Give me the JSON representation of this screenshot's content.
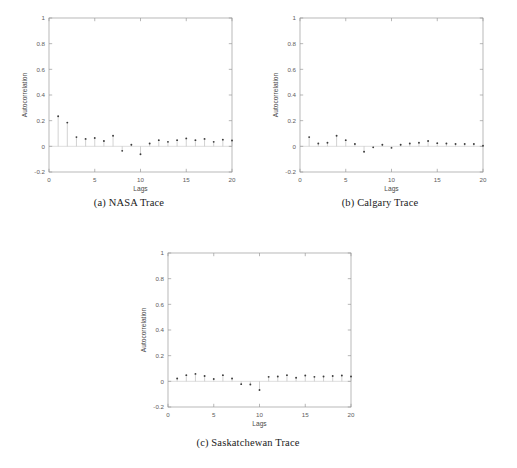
{
  "figure": {
    "background_color": "#ffffff",
    "axis_color": "#9a9a9a",
    "stem_color": "#b9b9b9",
    "marker_color": "#3c3c3c",
    "panels": [
      {
        "id": "nasa",
        "caption": "(a) NASA Trace",
        "caption_label": "(a)",
        "caption_title": "NASA Trace"
      },
      {
        "id": "calgary",
        "caption": "(b) Calgary Trace",
        "caption_label": "(b)",
        "caption_title": "Calgary Trace"
      },
      {
        "id": "saskatchewan",
        "caption": "(c) Saskatchewan Trace",
        "caption_label": "(c)",
        "caption_title": "Saskatchewan Trace"
      }
    ]
  },
  "chart_data": [
    {
      "type": "scatter",
      "id": "nasa",
      "title": "(a) NASA Trace",
      "xlabel": "Lags",
      "ylabel": "Autocorrelation",
      "xlim": [
        0,
        20
      ],
      "ylim": [
        -0.2,
        1
      ],
      "xticks": [
        0,
        5,
        10,
        15,
        20
      ],
      "yticks": [
        -0.2,
        0,
        0.2,
        0.4,
        0.6,
        0.8,
        1
      ],
      "xticklabels": [
        "0",
        "5",
        "10",
        "15",
        "20"
      ],
      "yticklabels": [
        "-0.2",
        "0",
        "0.2",
        "0.4",
        "0.6",
        "0.8",
        "1"
      ],
      "grid": false,
      "legend": "none",
      "x": [
        1,
        2,
        3,
        4,
        5,
        6,
        7,
        8,
        9,
        10,
        11,
        12,
        13,
        14,
        15,
        16,
        17,
        18,
        19,
        20
      ],
      "values": [
        0.235,
        0.185,
        0.072,
        0.058,
        0.065,
        0.042,
        0.082,
        -0.035,
        0.012,
        -0.062,
        0.022,
        0.048,
        0.035,
        0.048,
        0.062,
        0.048,
        0.058,
        0.035,
        0.052,
        0.045
      ]
    },
    {
      "type": "scatter",
      "id": "calgary",
      "title": "(b) Calgary Trace",
      "xlabel": "Lags",
      "ylabel": "Autocorrelation",
      "xlim": [
        0,
        20
      ],
      "ylim": [
        -0.2,
        1
      ],
      "xticks": [
        0,
        5,
        10,
        15,
        20
      ],
      "yticks": [
        -0.2,
        0,
        0.2,
        0.4,
        0.6,
        0.8,
        1
      ],
      "xticklabels": [
        "0",
        "5",
        "10",
        "15",
        "20"
      ],
      "yticklabels": [
        "-0.2",
        "0",
        "0.2",
        "0.4",
        "0.6",
        "0.8",
        "1"
      ],
      "grid": false,
      "legend": "none",
      "x": [
        1,
        2,
        3,
        4,
        5,
        6,
        7,
        8,
        9,
        10,
        11,
        12,
        13,
        14,
        15,
        16,
        17,
        18,
        19,
        20
      ],
      "values": [
        0.072,
        0.022,
        0.028,
        0.082,
        0.048,
        0.018,
        -0.042,
        -0.008,
        0.012,
        -0.012,
        0.012,
        0.022,
        0.028,
        0.042,
        0.025,
        0.022,
        0.018,
        0.018,
        0.018,
        0.005
      ]
    },
    {
      "type": "scatter",
      "id": "saskatchewan",
      "title": "(c) Saskatchewan Trace",
      "xlabel": "Lags",
      "ylabel": "Autocorrelation",
      "xlim": [
        0,
        20
      ],
      "ylim": [
        -0.2,
        1
      ],
      "xticks": [
        0,
        5,
        10,
        15,
        20
      ],
      "yticks": [
        -0.2,
        0,
        0.2,
        0.4,
        0.6,
        0.8,
        1
      ],
      "xticklabels": [
        "0",
        "5",
        "10",
        "15",
        "20"
      ],
      "yticklabels": [
        "-0.2",
        "0",
        "0.2",
        "0.4",
        "0.6",
        "0.8",
        "1"
      ],
      "grid": false,
      "legend": "none",
      "x": [
        1,
        2,
        3,
        4,
        5,
        6,
        7,
        8,
        9,
        10,
        11,
        12,
        13,
        14,
        15,
        16,
        17,
        18,
        19,
        20
      ],
      "values": [
        0.022,
        0.048,
        0.058,
        0.042,
        0.018,
        0.048,
        0.022,
        -0.022,
        -0.025,
        -0.068,
        0.035,
        0.038,
        0.048,
        0.028,
        0.045,
        0.035,
        0.038,
        0.042,
        0.045,
        0.038
      ]
    }
  ]
}
